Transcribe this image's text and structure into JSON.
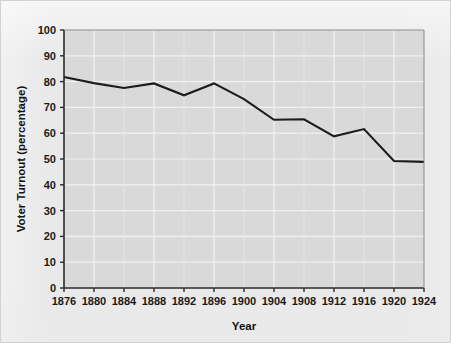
{
  "figure": {
    "background_color": "#e9e9e9",
    "plot_background_color": "#d9d9d9",
    "gridline_color": "#f2f2f2",
    "axis_color": "#2b2b2b",
    "line_color": "#1c1c1c"
  },
  "chart_data": {
    "type": "line",
    "title": "",
    "xlabel": "Year",
    "ylabel": "Voter Turnout (percentage)",
    "xlim": [
      1876,
      1924
    ],
    "ylim": [
      0,
      100
    ],
    "grid": true,
    "legend": "none",
    "categories": [
      1876,
      1880,
      1884,
      1888,
      1892,
      1896,
      1900,
      1904,
      1908,
      1912,
      1916,
      1920,
      1924
    ],
    "x_tick_labels": [
      "1876",
      "1880",
      "1884",
      "1888",
      "1892",
      "1896",
      "1900",
      "1904",
      "1908",
      "1912",
      "1916",
      "1920",
      "1924"
    ],
    "y_tick_labels": [
      "0",
      "10",
      "20",
      "30",
      "40",
      "50",
      "60",
      "70",
      "80",
      "90",
      "100"
    ],
    "y_ticks": [
      0,
      10,
      20,
      30,
      40,
      50,
      60,
      70,
      80,
      90,
      100
    ],
    "series": [
      {
        "name": "Voter Turnout",
        "values": [
          81.8,
          79.4,
          77.5,
          79.3,
          74.7,
          79.3,
          73.2,
          65.2,
          65.4,
          58.8,
          61.6,
          49.2,
          48.9
        ]
      }
    ]
  }
}
